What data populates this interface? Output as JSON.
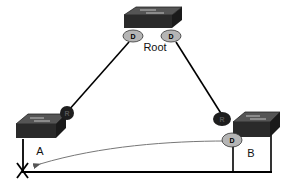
{
  "diagram": {
    "type": "spanning-tree-topology",
    "switches": [
      {
        "id": "root",
        "label": "Root"
      },
      {
        "id": "a",
        "label": "A"
      },
      {
        "id": "b",
        "label": "B"
      }
    ],
    "ports": {
      "root_left": {
        "role": "D",
        "label": "D"
      },
      "root_right": {
        "role": "D",
        "label": "D"
      },
      "a_uplink": {
        "role": "R",
        "label": "R"
      },
      "b_uplink": {
        "role": "R",
        "label": "R"
      },
      "b_downlink": {
        "role": "D",
        "label": "D"
      }
    },
    "links": [
      {
        "from": "root_left",
        "to": "a_uplink",
        "state": "forwarding"
      },
      {
        "from": "root_right",
        "to": "b_uplink",
        "state": "forwarding"
      },
      {
        "from": "b_downlink",
        "to": "a",
        "state": "failed",
        "marker": "X"
      }
    ],
    "annotations": {
      "failure_marker": "X",
      "arrow": "B designated port toward A (BPDU path)"
    },
    "colors": {
      "switch_body": "#2a2a2a",
      "switch_top": "#555555",
      "designated_port": "#b5b5b5",
      "root_port": "#1e1e1e",
      "link": "#000000",
      "arrow": "#777777"
    }
  }
}
